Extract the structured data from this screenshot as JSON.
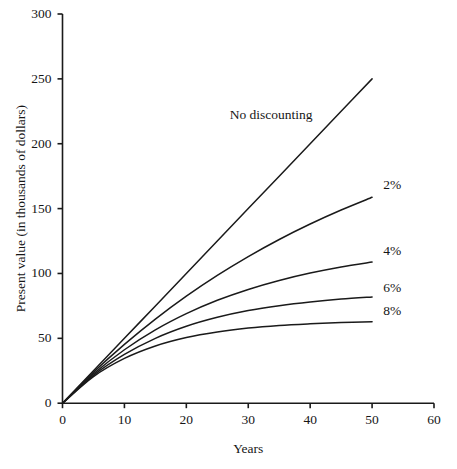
{
  "chart_data": {
    "type": "line",
    "title": "",
    "xlabel": "Years",
    "ylabel": "Present value (in thousands of dollars)",
    "xlim": [
      0,
      60
    ],
    "ylim": [
      0,
      300
    ],
    "xticks": [
      0,
      10,
      20,
      30,
      40,
      50,
      60
    ],
    "yticks": [
      0,
      50,
      100,
      150,
      200,
      250,
      300
    ],
    "xtick_labels": [
      "0",
      "10",
      "20",
      "30",
      "40",
      "50",
      "60"
    ],
    "ytick_labels": [
      "0",
      "50",
      "100",
      "150",
      "200",
      "250",
      "300"
    ],
    "grid": false,
    "legend_position": "inline-right-of-curve-ends",
    "line_color": "#1a1a1a",
    "x": [
      0,
      5,
      10,
      15,
      20,
      25,
      30,
      35,
      40,
      45,
      50
    ],
    "series": [
      {
        "name": "No discounting",
        "rate_percent": 0,
        "label": "No discounting",
        "label_x": 27.0,
        "label_y": 222,
        "values": [
          0,
          25,
          50,
          75,
          100,
          125,
          150,
          175,
          200,
          225,
          250
        ]
      },
      {
        "name": "2%",
        "rate_percent": 2,
        "label": "2%",
        "label_x": 51.8,
        "label_y": 168,
        "values": [
          0,
          23.8,
          45.3,
          64.8,
          82.5,
          98.5,
          113.0,
          126.2,
          138.1,
          148.9,
          158.7
        ]
      },
      {
        "name": "4%",
        "rate_percent": 4,
        "label": "4%",
        "label_x": 51.8,
        "label_y": 117,
        "values": [
          0,
          22.6,
          41.2,
          56.5,
          69.0,
          79.3,
          87.7,
          94.6,
          100.3,
          105.0,
          108.8
        ]
      },
      {
        "name": "6%",
        "rate_percent": 6,
        "label": "6%",
        "label_x": 51.8,
        "label_y": 89,
        "values": [
          0,
          21.5,
          37.6,
          50.0,
          59.3,
          66.2,
          71.4,
          75.2,
          78.1,
          80.3,
          81.9
        ]
      },
      {
        "name": "8%",
        "rate_percent": 8,
        "label": "8%",
        "label_x": 51.8,
        "label_y": 71,
        "values": [
          0,
          20.5,
          34.5,
          44.1,
          50.6,
          54.9,
          57.9,
          59.9,
          61.2,
          62.2,
          62.8
        ]
      }
    ]
  }
}
